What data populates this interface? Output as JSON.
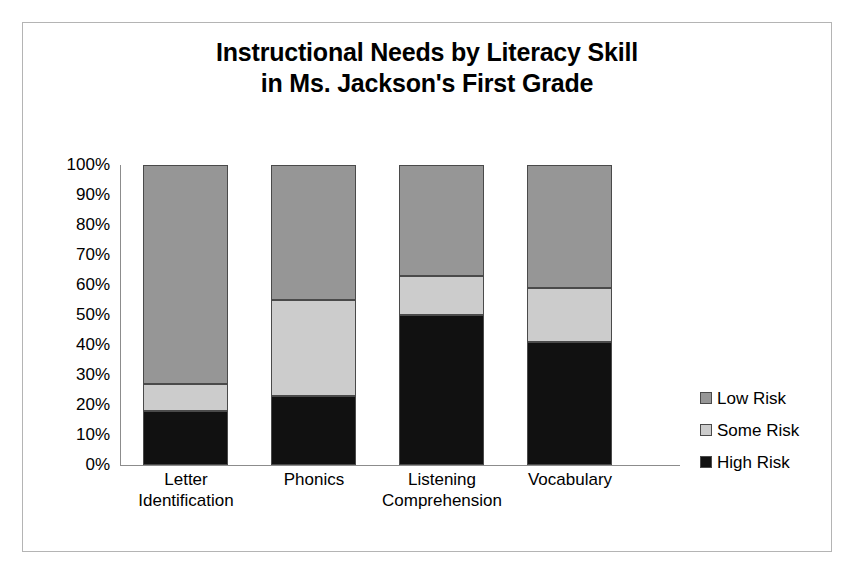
{
  "chart_data": {
    "type": "bar",
    "subtype": "stacked-percent-column",
    "title": "Instructional Needs by Literacy Skill in Ms. Jackson's First Grade",
    "title_lines": [
      "Instructional Needs by Literacy Skill",
      "in Ms. Jackson's First Grade"
    ],
    "categories": [
      "Letter Identification",
      "Phonics",
      "Listening Comprehension",
      "Vocabulary"
    ],
    "category_lines": [
      [
        "Letter",
        "Identification"
      ],
      [
        "Phonics"
      ],
      [
        "Listening",
        "Comprehension"
      ],
      [
        "Vocabulary"
      ]
    ],
    "series": [
      {
        "name": "High Risk",
        "color": "#111111",
        "values": [
          18,
          23,
          50,
          41
        ]
      },
      {
        "name": "Some Risk",
        "color": "#cccccc",
        "values": [
          9,
          32,
          13,
          18
        ]
      },
      {
        "name": "Low Risk",
        "color": "#969696",
        "values": [
          73,
          45,
          37,
          41
        ]
      }
    ],
    "cumulative_tops": {
      "high_risk": [
        18,
        23,
        50,
        41
      ],
      "some_risk": [
        27,
        55,
        63,
        59
      ],
      "low_risk": [
        100,
        100,
        100,
        100
      ]
    },
    "xlabel": "",
    "ylabel": "",
    "ylim": [
      0,
      100
    ],
    "ytick_values": [
      100,
      90,
      80,
      70,
      60,
      50,
      40,
      30,
      20,
      10,
      0
    ],
    "ytick_labels": [
      "100%",
      "90%",
      "80%",
      "70%",
      "60%",
      "50%",
      "40%",
      "30%",
      "20%",
      "10%",
      "0%"
    ],
    "grid": false,
    "legend_position": "right",
    "legend_entries": [
      {
        "label": "Low Risk",
        "color": "#969696"
      },
      {
        "label": "Some Risk",
        "color": "#cccccc"
      },
      {
        "label": "High Risk",
        "color": "#111111"
      }
    ],
    "frame_border_color": "#b4b4b4",
    "axis_color": "#8c8c8c",
    "background": "#ffffff"
  }
}
